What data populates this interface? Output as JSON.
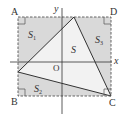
{
  "figure": {
    "points": {
      "A": {
        "label": "A",
        "x": 18,
        "y": 17
      },
      "D": {
        "label": "D",
        "x": 111,
        "y": 17
      },
      "B": {
        "label": "B",
        "x": 18,
        "y": 96
      },
      "C": {
        "label": "C",
        "x": 111,
        "y": 96
      },
      "O": {
        "label": "O"
      }
    },
    "axes": {
      "x_label": "x",
      "y_label": "y"
    },
    "regions": {
      "S": {
        "label": "S"
      },
      "S1": {
        "label": "S",
        "sub": "1"
      },
      "S2": {
        "label": "S",
        "sub": "2"
      },
      "S3": {
        "label": "S",
        "sub": "3"
      }
    },
    "triangle": {
      "vertices": [
        [
          74,
          17
        ],
        [
          18,
          72
        ],
        [
          111,
          96
        ]
      ]
    },
    "colors": {
      "shade": "#d9d9d9",
      "triangle_fill": "#f2f2f2",
      "line": "#333333",
      "dashed": "#555555"
    }
  }
}
